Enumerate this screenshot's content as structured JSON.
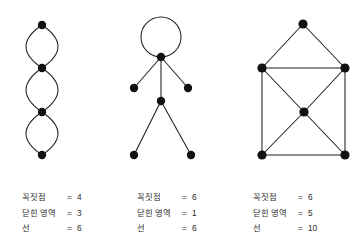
{
  "page": {
    "background_color": "#ffffff",
    "ink_color": "#111111",
    "text_color": "#2b2b2b"
  },
  "figures": [
    {
      "id": "chain-of-loops",
      "name": "chain-of-three-lenses-graph",
      "vertices": [
        {
          "x": 42,
          "y": 25
        },
        {
          "x": 42,
          "y": 68
        },
        {
          "x": 42,
          "y": 112
        },
        {
          "x": 42,
          "y": 155
        }
      ],
      "vertex_radius": 4.2,
      "edges": [
        {
          "type": "arc",
          "from": 0,
          "to": 1,
          "bulge": -16
        },
        {
          "type": "arc",
          "from": 0,
          "to": 1,
          "bulge": 16
        },
        {
          "type": "arc",
          "from": 1,
          "to": 2,
          "bulge": -16
        },
        {
          "type": "arc",
          "from": 1,
          "to": 2,
          "bulge": 16
        },
        {
          "type": "arc",
          "from": 2,
          "to": 3,
          "bulge": -16
        },
        {
          "type": "arc",
          "from": 2,
          "to": 3,
          "bulge": 16
        }
      ]
    },
    {
      "id": "stick-figure",
      "name": "stick-figure-graph",
      "vertices": [
        {
          "x": 161,
          "y": 57
        },
        {
          "x": 134,
          "y": 88
        },
        {
          "x": 188,
          "y": 88
        },
        {
          "x": 161,
          "y": 101
        },
        {
          "x": 134,
          "y": 155
        },
        {
          "x": 191,
          "y": 155
        }
      ],
      "vertex_radius": 4.2,
      "head_loop": {
        "cx": 161,
        "cy": 37,
        "r": 20
      },
      "edges": [
        {
          "type": "loop",
          "at": 0
        },
        {
          "type": "line",
          "from": 0,
          "to": 1
        },
        {
          "type": "line",
          "from": 0,
          "to": 2
        },
        {
          "type": "line",
          "from": 0,
          "to": 3
        },
        {
          "type": "line",
          "from": 3,
          "to": 4
        },
        {
          "type": "line",
          "from": 3,
          "to": 5
        }
      ]
    },
    {
      "id": "house-with-center",
      "name": "house-graph-with-center-vertex",
      "vertices": [
        {
          "x": 303,
          "y": 24
        },
        {
          "x": 262,
          "y": 68
        },
        {
          "x": 345,
          "y": 68
        },
        {
          "x": 304,
          "y": 112
        },
        {
          "x": 262,
          "y": 155
        },
        {
          "x": 345,
          "y": 155
        }
      ],
      "vertex_radius": 4.6,
      "edges": [
        {
          "type": "line",
          "from": 0,
          "to": 1
        },
        {
          "type": "line",
          "from": 0,
          "to": 2
        },
        {
          "type": "line",
          "from": 1,
          "to": 2
        },
        {
          "type": "line",
          "from": 1,
          "to": 4
        },
        {
          "type": "line",
          "from": 2,
          "to": 5
        },
        {
          "type": "line",
          "from": 4,
          "to": 5
        },
        {
          "type": "line",
          "from": 1,
          "to": 3
        },
        {
          "type": "line",
          "from": 2,
          "to": 3
        },
        {
          "type": "line",
          "from": 3,
          "to": 4
        },
        {
          "type": "line",
          "from": 3,
          "to": 5
        }
      ]
    }
  ],
  "labels": {
    "terms": {
      "vertices": "꼭짓점",
      "regions": "닫힌 영역",
      "lines": "선"
    },
    "equals": "=",
    "blocks": [
      {
        "vertices": "4",
        "regions": "3",
        "lines": "6"
      },
      {
        "vertices": "6",
        "regions": "1",
        "lines": "6"
      },
      {
        "vertices": "6",
        "regions": "5",
        "lines": "10"
      }
    ]
  }
}
